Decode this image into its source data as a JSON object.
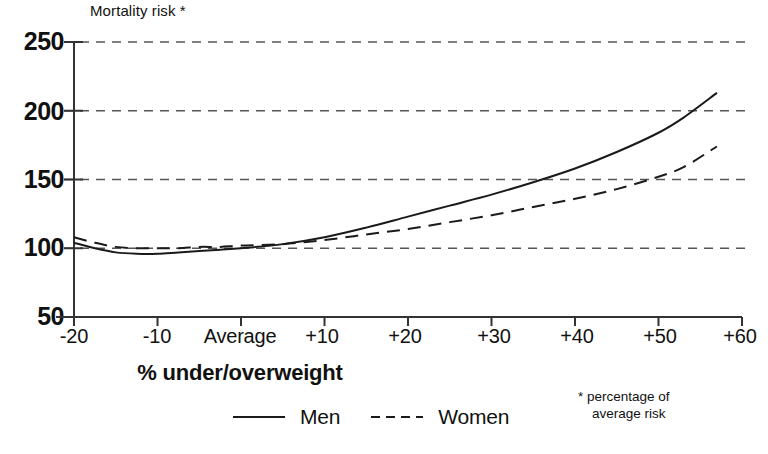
{
  "chart_data": {
    "type": "line",
    "title": "Mortality risk *",
    "xlabel": "% under/overweight",
    "ylabel": "Mortality risk *",
    "ylim": [
      50,
      250
    ],
    "xlim": [
      -20,
      60
    ],
    "grid": true,
    "legend_position": "bottom",
    "yticks": [
      250,
      200,
      150,
      100,
      50
    ],
    "ytick_labels": [
      "250",
      "200",
      "150",
      "100",
      "50"
    ],
    "xticks": [
      -20,
      -10,
      0,
      10,
      20,
      30,
      40,
      50,
      60
    ],
    "xtick_labels": [
      "-20",
      "-10",
      "Average",
      "+10",
      "+20",
      "+30",
      "+40",
      "+50",
      "+60"
    ],
    "annotation": "* percentage of average risk",
    "series": [
      {
        "name": "Men",
        "style": "solid",
        "color": "#1a1a1a",
        "x": [
          -20,
          -17.5,
          -15,
          -12.5,
          -10,
          -7.5,
          -5,
          -2.5,
          0,
          5,
          10,
          15,
          20,
          25,
          30,
          35,
          40,
          45,
          50,
          53,
          57
        ],
        "values": [
          104,
          100,
          97,
          96,
          96,
          97,
          98,
          99,
          100,
          103,
          108,
          115,
          123,
          131,
          139,
          148,
          158,
          170,
          184,
          195,
          213
        ]
      },
      {
        "name": "Women",
        "style": "dashed",
        "color": "#1a1a1a",
        "x": [
          -20,
          -17.5,
          -15,
          -12.5,
          -10,
          -7.5,
          -5,
          -2.5,
          0,
          5,
          10,
          15,
          20,
          25,
          30,
          35,
          40,
          45,
          50,
          53,
          57
        ],
        "values": [
          108,
          104,
          101,
          100,
          100,
          100,
          101,
          101,
          102,
          103,
          106,
          110,
          114,
          119,
          124,
          130,
          136,
          143,
          152,
          159,
          174
        ]
      }
    ]
  },
  "legend": {
    "men_label": "Men",
    "women_label": "Women"
  },
  "footnote": {
    "line1": "* percentage of",
    "line2": "average risk"
  }
}
